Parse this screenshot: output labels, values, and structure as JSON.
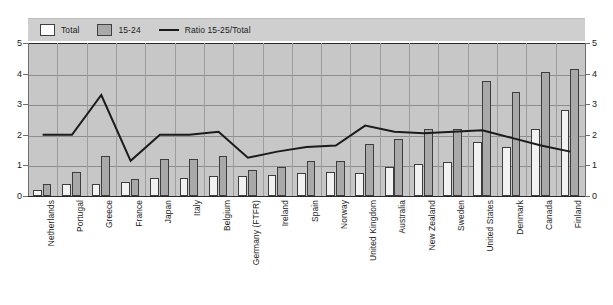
{
  "legend": {
    "items": [
      {
        "label": "Total",
        "marker": "white-square-icon"
      },
      {
        "label": "15-24",
        "marker": "gray-square-icon"
      },
      {
        "label": "Ratio 15-25/Total",
        "marker": "line-segment-icon"
      }
    ]
  },
  "axis": {
    "left_ticks": [
      "5",
      "4",
      "3",
      "2",
      "1",
      "0"
    ],
    "right_ticks": [
      "5",
      "4",
      "3",
      "2",
      "1",
      "0"
    ]
  },
  "chart_data": {
    "type": "bar",
    "title": "",
    "subtitle": "",
    "xlabel": "",
    "ylabel": "",
    "ylim": [
      0,
      5
    ],
    "y_ticks": [
      0,
      1,
      2,
      3,
      4,
      5
    ],
    "grid": true,
    "legend_position": "top-left",
    "categories": [
      "Netherlands",
      "Portugal",
      "Greece",
      "France",
      "Japan",
      "Italy",
      "Belgium",
      "Germany (FTFR)",
      "Ireland",
      "Spain",
      "Norway",
      "United Kingdom",
      "Australia",
      "New Zealand",
      "Sweden",
      "United States",
      "Denmark",
      "Canada",
      "Finland"
    ],
    "series": [
      {
        "name": "Total",
        "type": "bar",
        "color": "#f2f2f2",
        "values": [
          0.2,
          0.4,
          0.4,
          0.45,
          0.6,
          0.6,
          0.65,
          0.65,
          0.7,
          0.75,
          0.8,
          0.75,
          0.95,
          1.05,
          1.1,
          1.75,
          1.6,
          2.2,
          2.8
        ]
      },
      {
        "name": "15-24",
        "type": "bar",
        "color": "#a9a9a9",
        "values": [
          0.4,
          0.8,
          1.3,
          0.55,
          1.2,
          1.2,
          1.3,
          0.85,
          0.95,
          1.15,
          1.15,
          1.7,
          1.85,
          2.2,
          2.2,
          3.75,
          3.4,
          4.05,
          4.15
        ]
      },
      {
        "name": "Ratio 15-25/Total",
        "type": "line",
        "color": "#1b1b1b",
        "values": [
          2.0,
          2.0,
          3.3,
          1.15,
          2.0,
          2.0,
          2.1,
          1.25,
          1.45,
          1.6,
          1.65,
          2.3,
          2.1,
          2.05,
          2.1,
          2.15,
          1.9,
          1.65,
          1.45
        ]
      }
    ]
  }
}
